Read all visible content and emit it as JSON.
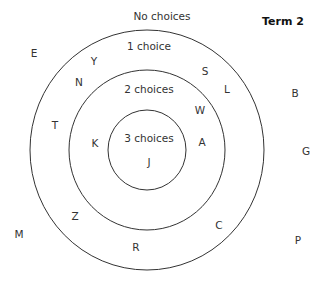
{
  "title": "Term 2",
  "rings": [
    {
      "label": "No choices",
      "x": 162,
      "y": 16
    },
    {
      "label": "1 choice",
      "x": 149,
      "y": 46
    },
    {
      "label": "2 choices",
      "x": 149,
      "y": 89
    },
    {
      "label": "3 choices",
      "x": 149,
      "y": 138
    }
  ],
  "circles": [
    {
      "cx": 147,
      "cy": 150,
      "rx": 117,
      "ry": 120
    },
    {
      "cx": 147,
      "cy": 150,
      "rx": 78,
      "ry": 80
    },
    {
      "cx": 147,
      "cy": 150,
      "rx": 39,
      "ry": 40
    }
  ],
  "stroke_color": "#333333",
  "points": [
    {
      "name": "E",
      "x": 34,
      "y": 53
    },
    {
      "name": "Y",
      "x": 94,
      "y": 61
    },
    {
      "name": "N",
      "x": 79,
      "y": 82
    },
    {
      "name": "S",
      "x": 205,
      "y": 71
    },
    {
      "name": "L",
      "x": 227,
      "y": 89
    },
    {
      "name": "B",
      "x": 295,
      "y": 93
    },
    {
      "name": "W",
      "x": 200,
      "y": 110
    },
    {
      "name": "T",
      "x": 55,
      "y": 125
    },
    {
      "name": "K",
      "x": 95,
      "y": 143
    },
    {
      "name": "A",
      "x": 202,
      "y": 142
    },
    {
      "name": "G",
      "x": 306,
      "y": 151
    },
    {
      "name": "J",
      "x": 149,
      "y": 162
    },
    {
      "name": "Z",
      "x": 75,
      "y": 216
    },
    {
      "name": "C",
      "x": 219,
      "y": 225
    },
    {
      "name": "M",
      "x": 19,
      "y": 234
    },
    {
      "name": "P",
      "x": 298,
      "y": 240
    },
    {
      "name": "R",
      "x": 136,
      "y": 247
    }
  ]
}
